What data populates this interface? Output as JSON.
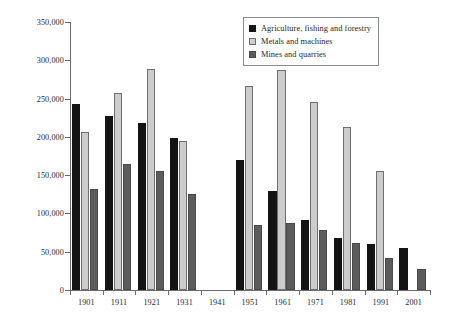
{
  "chart_data": {
    "type": "bar",
    "title": "",
    "subtitle": "",
    "xlabel": "",
    "ylabel": "",
    "grid": false,
    "legend_position": "top-right",
    "categories": [
      "1901",
      "1911",
      "1921",
      "1931",
      "1941",
      "1951",
      "1961",
      "1971",
      "1981",
      "1991",
      "2001"
    ],
    "ylim": [
      0,
      350000
    ],
    "ytick_values": [
      0,
      50000,
      100000,
      150000,
      200000,
      250000,
      300000,
      350000
    ],
    "ytick_labels": [
      "0",
      "50,000",
      "100,000",
      "150,000",
      "200,000",
      "250,000",
      "300,000",
      "350,000"
    ],
    "xtick_labels": [
      "1901",
      "1911",
      "1921",
      "1931",
      "1941",
      "1951",
      "1961",
      "1971",
      "1981",
      "1991",
      "2001"
    ],
    "series": [
      {
        "name": "Agriculture, fishing and forestry",
        "color": "#141414",
        "values": [
          243000,
          227000,
          218000,
          199000,
          null,
          170000,
          129000,
          92000,
          68000,
          60000,
          55000
        ]
      },
      {
        "name": "Metals and machines",
        "color": "#cccccc",
        "values": [
          206000,
          257000,
          288000,
          194000,
          null,
          267000,
          287000,
          246000,
          213000,
          155000,
          null
        ]
      },
      {
        "name": "Mines and quarries",
        "color": "#5c5c5c",
        "values": [
          132000,
          164000,
          155000,
          125000,
          null,
          85000,
          87000,
          79000,
          62000,
          42000,
          28000
        ]
      }
    ]
  },
  "legend": {
    "entries": [
      {
        "label": "Agriculture, fishing and forestry"
      },
      {
        "label": "Metals and machines"
      },
      {
        "label": "Mines and quarries"
      }
    ]
  }
}
